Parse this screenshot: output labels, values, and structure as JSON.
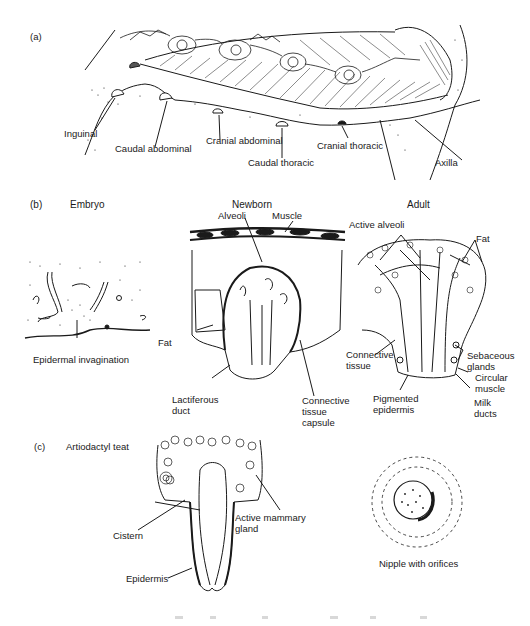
{
  "panel_a": {
    "marker": "(a)",
    "labels": {
      "inguinal": "Inguinal",
      "caudal_abdominal": "Caudal abdominal",
      "cranial_abdominal": "Cranial abdominal",
      "caudal_thoracic": "Caudal thoracic",
      "cranial_thoracic": "Cranial thoracic",
      "axilla": "Axilla"
    }
  },
  "panel_b": {
    "marker": "(b)",
    "embryo": {
      "title": "Embryo",
      "labels": {
        "epidermal_invagination": "Epidermal invagination"
      }
    },
    "newborn": {
      "title": "Newborn",
      "labels": {
        "alveoli": "Alveoli",
        "muscle": "Muscle",
        "fat": "Fat",
        "lactiferous_duct": "Lactiferous\nduct",
        "connective_tissue_capsule": "Connective\ntissue\ncapsule"
      }
    },
    "adult": {
      "title": "Adult",
      "labels": {
        "active_alveoli": "Active alveoli",
        "fat": "Fat",
        "connective_tissue": "Connective\ntissue",
        "sebaceous_glands": "Sebaceous\nglands",
        "circular_muscle": "Circular\nmuscle",
        "pigmented_epidermis": "Pigmented\nepidermis",
        "milk_ducts": "Milk\nducts"
      }
    }
  },
  "panel_c": {
    "marker": "(c)",
    "title": "Artiodactyl teat",
    "labels": {
      "cistern": "Cistern",
      "active_mammary_gland": "Active mammary\ngland",
      "epidermis": "Epidermis",
      "nipple_with_orifices": "Nipple with orifices"
    }
  },
  "colors": {
    "ink": "#1a1a1a",
    "background": "#ffffff"
  }
}
